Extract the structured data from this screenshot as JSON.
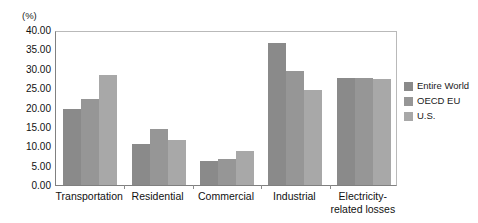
{
  "chart_data": {
    "type": "bar",
    "title": "",
    "xlabel": "",
    "ylabel": "(%)",
    "unit_label": "(%)",
    "categories": [
      "Transportation",
      "Residential",
      "Commercial",
      "Industrial",
      "Electricity-related losses"
    ],
    "category_label_lines": [
      [
        "Transportation"
      ],
      [
        "Residential"
      ],
      [
        "Commercial"
      ],
      [
        "Industrial"
      ],
      [
        "Electricity-",
        "related losses"
      ]
    ],
    "series": [
      {
        "name": "Entire World",
        "color": "#8a8a8a",
        "values": [
          19.6,
          10.7,
          6.1,
          36.6,
          27.6
        ]
      },
      {
        "name": "OECD EU",
        "color": "#969696",
        "values": [
          22.2,
          14.5,
          6.7,
          29.5,
          27.6
        ]
      },
      {
        "name": "U.S.",
        "color": "#a8a8a8",
        "values": [
          28.3,
          11.7,
          8.8,
          24.5,
          27.3
        ]
      }
    ],
    "ylim": [
      0,
      40
    ],
    "ytick_step": 5,
    "ytick_labels": [
      "40.00",
      "35.00",
      "30.00",
      "25.00",
      "20.00",
      "15.00",
      "10.00",
      "5.00",
      "0.00"
    ],
    "ytick_values": [
      40,
      35,
      30,
      25,
      20,
      15,
      10,
      5,
      0
    ],
    "grid": false,
    "legend_position": "right",
    "legend": [
      "Entire World",
      "OECD EU",
      "U.S."
    ]
  }
}
